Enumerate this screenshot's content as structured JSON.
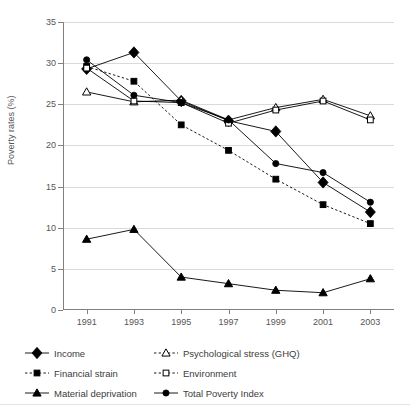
{
  "chart_data": {
    "type": "line",
    "title": "",
    "xlabel": "",
    "ylabel": "Poverty rates (%)",
    "categories": [
      "1991",
      "1993",
      "1995",
      "1997",
      "1999",
      "2001",
      "2003"
    ],
    "x": [
      1991,
      1993,
      1995,
      1997,
      1999,
      2001,
      2003
    ],
    "ylim": [
      0,
      35
    ],
    "yticks": [
      0,
      5,
      10,
      15,
      20,
      25,
      30,
      35
    ],
    "ytick_labels": [
      "0",
      "5",
      "10",
      "15",
      "20",
      "25",
      "30",
      "35"
    ],
    "grid": "horizontal",
    "legend_position": "bottom",
    "series": [
      {
        "name": "Income",
        "marker": "filled-diamond",
        "line": "solid",
        "color": "#000000",
        "values": [
          29.3,
          31.3,
          25.4,
          23.0,
          21.7,
          15.5,
          11.9
        ]
      },
      {
        "name": "Financial strain",
        "marker": "filled-square",
        "line": "dashed",
        "color": "#000000",
        "values": [
          29.6,
          27.8,
          22.5,
          19.4,
          15.9,
          12.8,
          10.5
        ]
      },
      {
        "name": "Material deprivation",
        "marker": "filled-triangle",
        "line": "solid",
        "color": "#000000",
        "values": [
          8.6,
          9.8,
          4.0,
          3.2,
          2.4,
          2.1,
          3.8
        ]
      },
      {
        "name": "Psychological stress (GHQ)",
        "marker": "open-triangle",
        "line": "solid",
        "color": "#000000",
        "values": [
          26.5,
          25.3,
          25.5,
          23.1,
          24.6,
          25.6,
          23.6
        ]
      },
      {
        "name": "Environment",
        "marker": "open-square",
        "line": "solid",
        "color": "#000000",
        "values": [
          29.4,
          25.4,
          25.2,
          22.7,
          24.3,
          25.4,
          23.1
        ]
      },
      {
        "name": "Total Poverty Index",
        "marker": "filled-circle",
        "line": "solid",
        "color": "#000000",
        "values": [
          30.4,
          26.1,
          25.2,
          23.1,
          17.8,
          16.7,
          13.1
        ]
      }
    ]
  },
  "legend": {
    "left_column": [
      {
        "label": "Income",
        "marker": "filled-diamond",
        "line": "solid"
      },
      {
        "label": "Financial strain",
        "marker": "filled-square",
        "line": "dashed"
      },
      {
        "label": "Material deprivation",
        "marker": "filled-triangle",
        "line": "solid"
      }
    ],
    "right_column": [
      {
        "label": "Psychological stress (GHQ)",
        "marker": "open-triangle",
        "line": "dashed"
      },
      {
        "label": "Environment",
        "marker": "open-square",
        "line": "dashed"
      },
      {
        "label": "Total Poverty Index",
        "marker": "filled-circle",
        "line": "solid"
      }
    ]
  },
  "colors": {
    "ink": "#000000",
    "axis": "#808080",
    "grid": "#d9d9d9",
    "text": "#3c3c3c",
    "tick_text": "#555555",
    "background": "#ffffff"
  }
}
